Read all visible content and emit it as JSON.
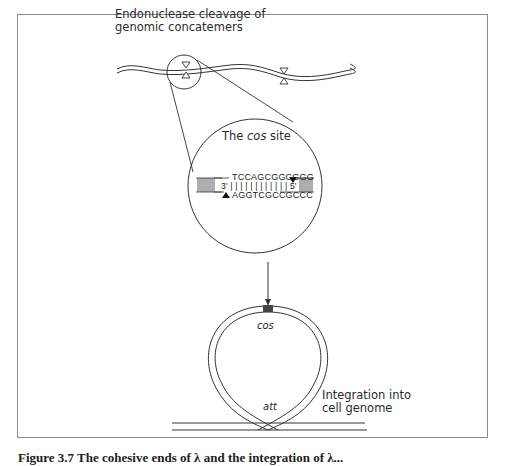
{
  "figure": {
    "top_label_line1": "Endonuclease cleavage of",
    "top_label_line2": "genomic concatemers",
    "cos_title_prefix": "The ",
    "cos_title_italic": "cos",
    "cos_title_suffix": " site",
    "sequence": {
      "top_strand": "TCCAGCGGCGGG",
      "bonds": "3' | | | | | | | | | | | | 5'",
      "bottom_strand": "AGGTCGCCGCCC"
    },
    "circle_cos_label": "cos",
    "att_label": "att",
    "integration_label_line1": "Integration into",
    "integration_label_line2": "cell genome",
    "caption": "Figure 3.7 The cohesive ends of λ and the integration of λ..."
  },
  "colors": {
    "line": "#333333",
    "frame": "#8a8a8a",
    "cos_block": "#444444"
  }
}
